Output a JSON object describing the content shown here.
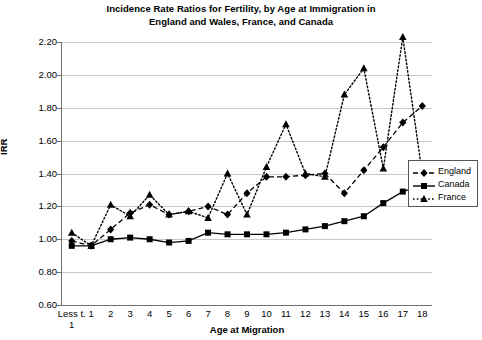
{
  "chart_data": {
    "type": "line",
    "title": "Incidence Rate Ratios for Fertility, by Age at Immigration in England and Wales, France, and Canada",
    "title_line1": "Incidence Rate Ratios for Fertility, by Age at Immigration in",
    "title_line2": "England and Wales, France, and Canada",
    "xlabel": "Age at Migration",
    "ylabel": "IRR",
    "ylim": [
      0.6,
      2.2
    ],
    "ytick_step": 0.2,
    "grid": true,
    "legend_position": "right",
    "categories": [
      "Less t. 1",
      "1",
      "2",
      "3",
      "4",
      "5",
      "6",
      "7",
      "8",
      "9",
      "10",
      "11",
      "12",
      "13",
      "14",
      "15",
      "16",
      "17",
      "18"
    ],
    "ytick_labels": [
      "2.20",
      "2.00",
      "1.80",
      "1.60",
      "1.40",
      "1.20",
      "1.00",
      "0.80",
      "0.60"
    ],
    "ytick_values": [
      2.2,
      2.0,
      1.8,
      1.6,
      1.4,
      1.2,
      1.0,
      0.8,
      0.6
    ],
    "series": [
      {
        "name": "England",
        "color": "#000000",
        "marker": "diamond",
        "line_style": "dashed",
        "values": [
          0.99,
          0.96,
          1.06,
          1.16,
          1.21,
          1.15,
          1.17,
          1.2,
          1.15,
          1.28,
          1.38,
          1.38,
          1.39,
          1.4,
          1.28,
          1.42,
          1.56,
          1.71,
          1.81
        ]
      },
      {
        "name": "Canada",
        "color": "#000000",
        "marker": "square",
        "line_style": "solid",
        "values": [
          0.96,
          0.96,
          1.0,
          1.01,
          1.0,
          0.98,
          0.99,
          1.04,
          1.03,
          1.03,
          1.03,
          1.04,
          1.06,
          1.08,
          1.11,
          1.14,
          1.22,
          1.29,
          1.33
        ]
      },
      {
        "name": "France",
        "color": "#000000",
        "marker": "triangle",
        "line_style": "dotted",
        "values": [
          1.04,
          0.96,
          1.21,
          1.14,
          1.27,
          1.15,
          1.17,
          1.13,
          1.4,
          1.15,
          1.44,
          1.7,
          1.4,
          1.38,
          1.88,
          2.04,
          1.43,
          2.23,
          1.4
        ]
      }
    ]
  },
  "legend": {
    "items": [
      {
        "label": "England"
      },
      {
        "label": "Canada"
      },
      {
        "label": "France"
      }
    ]
  },
  "x_first_label": {
    "top": "Less t.",
    "bottom": "1"
  }
}
